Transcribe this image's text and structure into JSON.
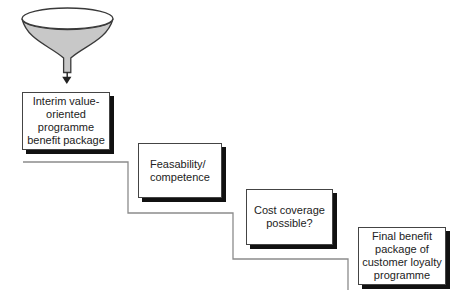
{
  "boxes": [
    {
      "label": "Interim value-\noriented\nprogramme\nbenefit package"
    },
    {
      "label": "Feasability/\ncompetence"
    },
    {
      "label": "Cost coverage\npossible?"
    },
    {
      "label": "Final benefit\npackage of\ncustomer loyalty\nprogramme"
    }
  ],
  "colors": {
    "background": "#ffffff",
    "funnel_fill": "#c8c8c8",
    "funnel_mouth_fill": "#ffffff",
    "outline": "#3a3a3a",
    "stair_line": "#8c8c8c",
    "box_border": "#444444",
    "box_shadow": "#111111",
    "text": "#222222"
  }
}
